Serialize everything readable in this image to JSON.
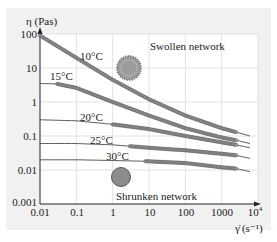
{
  "chart_data": {
    "type": "line",
    "title": "",
    "xlabel": "γ̇ (s⁻¹)",
    "ylabel": "η (Pas)",
    "xscale": "log",
    "yscale": "log",
    "xlim": [
      0.01,
      10000
    ],
    "ylim": [
      0.001,
      100
    ],
    "grid": true,
    "x_ticks": [
      "0.01",
      "0.1",
      "1",
      "10",
      "100",
      "1000",
      "10⁴"
    ],
    "y_ticks": [
      "0.001",
      "0.01",
      "0.1",
      "1",
      "10",
      "100"
    ],
    "series": [
      {
        "name": "10°C",
        "x": [
          0.01,
          0.1,
          1,
          10,
          100,
          1000,
          2500,
          6000
        ],
        "y": [
          90,
          20,
          4.5,
          1.2,
          0.4,
          0.17,
          0.13,
          0.1
        ]
      },
      {
        "name": "15°C",
        "x": [
          0.01,
          0.03,
          0.1,
          1,
          10,
          100,
          1000,
          2500,
          6000
        ],
        "y": [
          3.5,
          3.4,
          2.6,
          1.0,
          0.4,
          0.17,
          0.09,
          0.075,
          0.06
        ]
      },
      {
        "name": "20°C",
        "x": [
          0.01,
          0.1,
          1,
          10,
          100,
          1000,
          2500,
          6000
        ],
        "y": [
          0.3,
          0.28,
          0.22,
          0.16,
          0.1,
          0.065,
          0.055,
          0.045
        ]
      },
      {
        "name": "25°C",
        "x": [
          0.01,
          0.1,
          1,
          10,
          100,
          1000,
          2500,
          6000
        ],
        "y": [
          0.06,
          0.06,
          0.055,
          0.045,
          0.038,
          0.03,
          0.027,
          0.022
        ]
      },
      {
        "name": "30°C",
        "x": [
          0.01,
          0.1,
          1,
          10,
          100,
          1000,
          2500,
          6000
        ],
        "y": [
          0.02,
          0.02,
          0.019,
          0.018,
          0.016,
          0.012,
          0.011,
          0.009
        ]
      }
    ],
    "annotations": [
      "Swollen network",
      "Shrunken network",
      "10°C",
      "15°C",
      "20°C",
      "25°C",
      "30°C"
    ],
    "legend": "none (inline labels)"
  },
  "labels": {
    "y_axis": "η (Pas)",
    "x_axis_symbol": "γ̇",
    "x_axis_unit": "(s⁻¹)",
    "swollen": "Swollen network",
    "shrunken": "Shrunken network",
    "t10": "10°C",
    "t15": "15°C",
    "t20": "20°C",
    "t25": "25°C",
    "t30": "30°C"
  },
  "ticks": {
    "x": [
      "0.01",
      "0.1",
      "1",
      "10",
      "100",
      "1000"
    ],
    "x_last_base": "10",
    "x_last_exp": "4",
    "y": [
      "100",
      "10",
      "1",
      "0.1",
      "0.01",
      "0.001"
    ]
  },
  "colors": {
    "panel": "#f1f1f1",
    "plot": "#ffffff",
    "grid": "#e2e2e2",
    "curve": "#444444",
    "marker": "#9a9a9a",
    "swollen": "#8a8a8a",
    "shrunken": "#8c8c8c"
  }
}
